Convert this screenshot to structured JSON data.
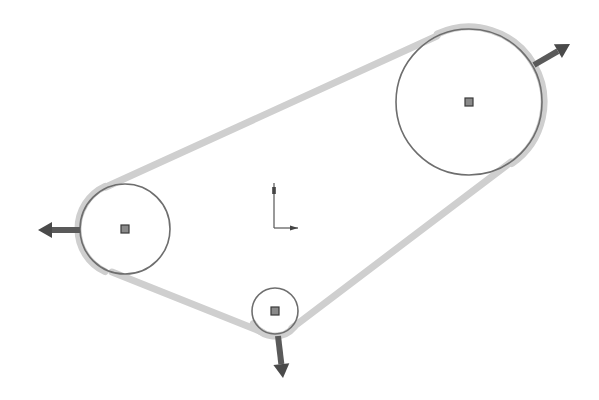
{
  "diagram": {
    "type": "belt-and-pulley sketch",
    "colors": {
      "background": "#ffffff",
      "belt": "#cfcfcf",
      "pulley_outline": "#6e6e6e",
      "center_point_fill": "#8a8a8a",
      "center_point_stroke": "#3a3a3a",
      "arrow": "#4a4a4a",
      "axis": "#555555"
    },
    "pulleys": [
      {
        "id": "large",
        "cx": 469,
        "cy": 102,
        "r": 73
      },
      {
        "id": "left",
        "cx": 125,
        "cy": 229,
        "r": 45
      },
      {
        "id": "small",
        "cx": 275,
        "cy": 311,
        "r": 23
      }
    ],
    "belt_segments": [
      {
        "from": "left-top",
        "x1": 106,
        "y1": 187,
        "x2": 437,
        "y2": 36
      },
      {
        "from": "large-bottom",
        "x1": 511,
        "y1": 162,
        "x2": 292,
        "y2": 328
      },
      {
        "from": "small-left",
        "x1": 262,
        "y1": 332,
        "x2": 112,
        "y2": 272
      }
    ],
    "force_arrows": [
      {
        "id": "arrow-large",
        "x1": 534,
        "y1": 65,
        "x2": 570,
        "y2": 44
      },
      {
        "id": "arrow-left",
        "x1": 80,
        "y1": 230,
        "x2": 38,
        "y2": 230
      },
      {
        "id": "arrow-small",
        "x1": 278,
        "y1": 336,
        "x2": 283,
        "y2": 378
      }
    ],
    "origin_axes": {
      "x": 274,
      "y": 228,
      "y_length": 45,
      "x_length": 24
    }
  }
}
